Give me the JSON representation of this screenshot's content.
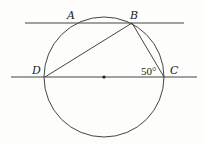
{
  "diagram": {
    "type": "geometry",
    "colors": {
      "stroke": "#333333",
      "background": "#fdfdfc"
    },
    "circle": {
      "cx": 104,
      "cy": 77,
      "r": 60
    },
    "lines": {
      "top_line": {
        "x1": 25,
        "y1": 23,
        "x2": 184,
        "y2": 23
      },
      "bottom_line": {
        "x1": 11,
        "y1": 77,
        "x2": 197,
        "y2": 77
      },
      "segment_DB": {
        "x1": 45,
        "y1": 77,
        "x2": 132,
        "y2": 23
      },
      "segment_BC": {
        "x1": 132,
        "y1": 23,
        "x2": 164,
        "y2": 77
      }
    },
    "points": {
      "A": {
        "label": "A",
        "x": 75,
        "y": 23
      },
      "B": {
        "label": "B",
        "x": 132,
        "y": 23
      },
      "C": {
        "label": "C",
        "x": 164,
        "y": 77
      },
      "D": {
        "label": "D",
        "x": 45,
        "y": 77
      },
      "O": {
        "label": "",
        "x": 104,
        "y": 77
      }
    },
    "angle_label": "50°"
  }
}
